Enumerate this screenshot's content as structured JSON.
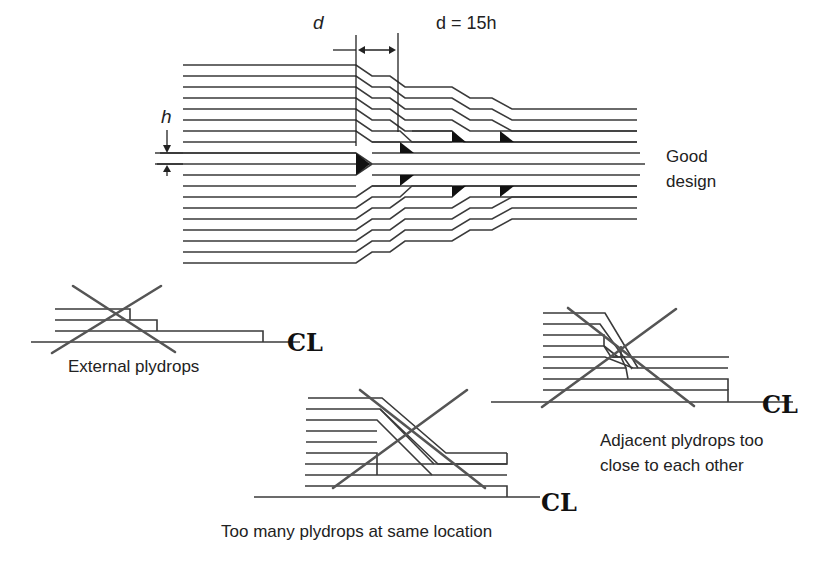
{
  "figure": {
    "top": {
      "d_label": "d",
      "d_formula": "d = 15h",
      "h_label": "h",
      "caption_line1": "Good",
      "caption_line2": "design"
    },
    "external": {
      "caption": "External plydrops",
      "centerline_symbol": "CL"
    },
    "same_location": {
      "caption": "Too many plydrops at same location",
      "centerline_symbol": "CL"
    },
    "adjacent": {
      "caption_line1": "Adjacent plydrops too",
      "caption_line2": "close to each other",
      "centerline_symbol": "CL"
    }
  },
  "colors": {
    "ply_line": "#3a3a3a",
    "cross_mark": "#555555",
    "resin_pocket": "#111111",
    "background": "#ffffff"
  }
}
